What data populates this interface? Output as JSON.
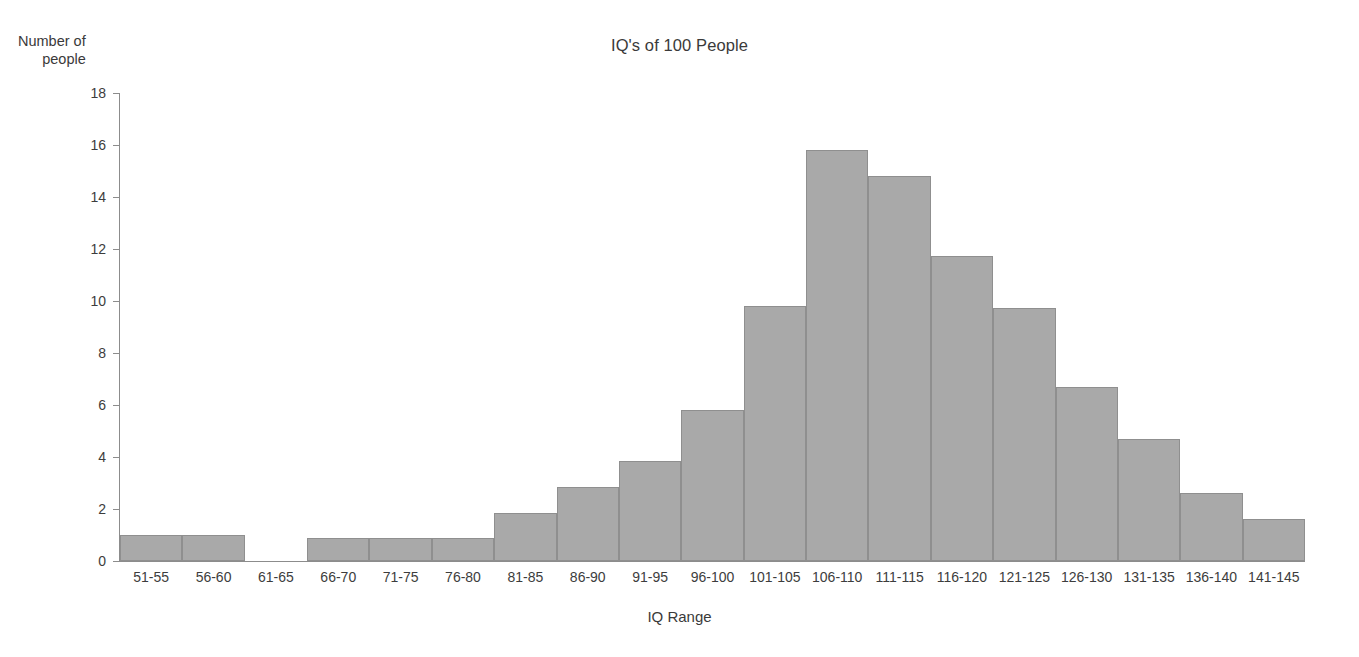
{
  "chart_data": {
    "type": "bar",
    "title": "IQ's of 100 People",
    "xlabel": "IQ Range",
    "ylabel_line1": "Number of",
    "ylabel_line2": "people",
    "categories": [
      "51-55",
      "56-60",
      "61-65",
      "66-70",
      "71-75",
      "76-80",
      "81-85",
      "86-90",
      "91-95",
      "96-100",
      "101-105",
      "106-110",
      "111-115",
      "116-120",
      "121-125",
      "126-130",
      "131-135",
      "136-140",
      "141-145"
    ],
    "values": [
      1.0,
      1.0,
      0,
      0.9,
      0.9,
      0.9,
      1.85,
      2.85,
      3.85,
      5.8,
      9.8,
      15.8,
      14.8,
      11.75,
      9.75,
      6.7,
      4.7,
      2.6,
      1.6
    ],
    "ylim": [
      0,
      18
    ],
    "ytick_labels": [
      "0",
      "2",
      "4",
      "6",
      "8",
      "10",
      "12",
      "14",
      "16",
      "18"
    ],
    "ytick_values": [
      0,
      2,
      4,
      6,
      8,
      10,
      12,
      14,
      16,
      18
    ],
    "grid": false,
    "legend": false,
    "bar_color": "#a9a9a9",
    "bar_border_color": "#8f8f8f",
    "axis_color": "#8c8c8c",
    "text_color": "#3a3a3a",
    "background": "#ffffff"
  }
}
